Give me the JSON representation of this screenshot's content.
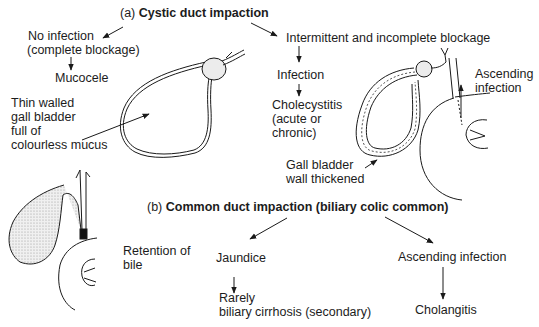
{
  "section_a": {
    "prefix": "(a)",
    "title": "Cystic duct impaction",
    "left_branch": {
      "cause_line1": "No infection",
      "cause_line2": "(complete blockage)",
      "result": "Mucocele",
      "annotation_line1": "Thin walled",
      "annotation_line2": "gall bladder",
      "annotation_line3": "full of",
      "annotation_line4": "colourless mucus"
    },
    "right_branch": {
      "cause": "Intermittent and incomplete blockage",
      "step1": "Infection",
      "result_line1": "Cholecystitis",
      "result_line2": "(acute or",
      "result_line3": "chronic)",
      "annotation_line1": "Gall bladder",
      "annotation_line2": "wall thickened",
      "side_label_line1": "Ascending",
      "side_label_line2": "infection"
    }
  },
  "section_b": {
    "prefix": "(b)",
    "title": "Common duct impaction (biliary colic common)",
    "annotation_line1": "Retention of",
    "annotation_line2": "bile",
    "left_branch": {
      "result": "Jaundice",
      "sequel_line1": "Rarely",
      "sequel_line2": "biliary cirrhosis (secondary)"
    },
    "right_branch": {
      "result": "Ascending infection",
      "sequel": "Cholangitis"
    }
  },
  "colors": {
    "line": "#1a1a1a",
    "stipple": "#c8c8c8",
    "background": "#ffffff"
  }
}
